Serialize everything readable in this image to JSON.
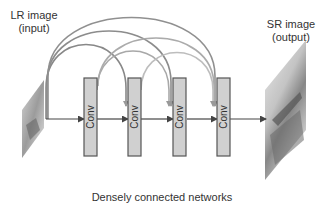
{
  "labels": {
    "input_line1": "LR image",
    "input_line2": "(input)",
    "output_line1": "SR image",
    "output_line2": "(output)",
    "caption": "Densely connected networks"
  },
  "blocks": [
    {
      "label": "Conv"
    },
    {
      "label": "Conv"
    },
    {
      "label": "Conv"
    },
    {
      "label": "Conv"
    }
  ],
  "colors": {
    "block_fill": "#d0d0d0",
    "block_stroke": "#555555",
    "arrow": "#444444",
    "arc_dark": "#888888",
    "arc_light": "#b5b5b5"
  }
}
